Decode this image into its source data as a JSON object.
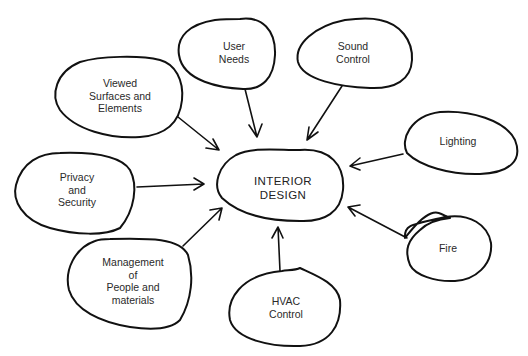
{
  "diagram": {
    "type": "concept-map",
    "center": {
      "label": "INTERIOR\nDESIGN"
    },
    "nodes": [
      {
        "id": "user-needs",
        "label": "User\nNeeds"
      },
      {
        "id": "sound-control",
        "label": "Sound\nControl"
      },
      {
        "id": "viewed-surfaces",
        "label": "Viewed\nSurfaces and\nElements"
      },
      {
        "id": "lighting",
        "label": "Lighting"
      },
      {
        "id": "privacy-security",
        "label": "Privacy\nand\nSecurity"
      },
      {
        "id": "fire",
        "label": "Fire"
      },
      {
        "id": "management",
        "label": "Management\nof\nPeople and\nmaterials"
      },
      {
        "id": "hvac-control",
        "label": "HVAC\nControl"
      }
    ],
    "edges": [
      {
        "from": "user-needs",
        "to": "center"
      },
      {
        "from": "sound-control",
        "to": "center"
      },
      {
        "from": "viewed-surfaces",
        "to": "center"
      },
      {
        "from": "lighting",
        "to": "center"
      },
      {
        "from": "privacy-security",
        "to": "center"
      },
      {
        "from": "fire",
        "to": "center"
      },
      {
        "from": "management",
        "to": "center"
      },
      {
        "from": "hvac-control",
        "to": "center"
      }
    ]
  }
}
